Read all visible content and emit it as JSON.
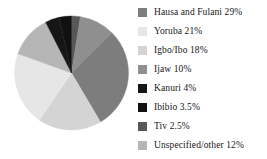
{
  "chart_data": {
    "type": "pie",
    "title": "",
    "subtitle": "",
    "xlabel": "",
    "ylabel": "",
    "legend_position": "right",
    "grid": false,
    "start_angle_deg": -90,
    "direction": "clockwise",
    "categories": [
      "Hausa and Fulani",
      "Yoruba",
      "Igbo/Ibo",
      "Ijaw",
      "Kanuri",
      "Ibibio",
      "Tiv",
      "Unspecified/other"
    ],
    "values": [
      29,
      21,
      18,
      10,
      4,
      3.5,
      2.5,
      12
    ],
    "value_unit": "%",
    "colors": [
      "#7d7d7d",
      "#e6e6e6",
      "#d4d4d4",
      "#8f8f8f",
      "#161616",
      "#111111",
      "#585858",
      "#b6b6b6"
    ],
    "slice_order_clockwise": [
      "Tiv",
      "Ijaw",
      "Hausa and Fulani",
      "Igbo/Ibo",
      "Yoruba",
      "Unspecified/other",
      "Kanuri",
      "Ibibio"
    ]
  },
  "legend": {
    "items": [
      {
        "label": "Hausa and Fulani 29%",
        "color": "#7d7d7d"
      },
      {
        "label": "Yoruba 21%",
        "color": "#e6e6e6"
      },
      {
        "label": "Igbo/Ibo 18%",
        "color": "#d4d4d4"
      },
      {
        "label": "Ijaw 10%",
        "color": "#8f8f8f"
      },
      {
        "label": "Kanuri 4%",
        "color": "#161616"
      },
      {
        "label": "Ibibio 3.5%",
        "color": "#111111"
      },
      {
        "label": "Tiv 2.5%",
        "color": "#585858"
      },
      {
        "label": "Unspecified/other 12%",
        "color": "#b6b6b6"
      }
    ]
  }
}
